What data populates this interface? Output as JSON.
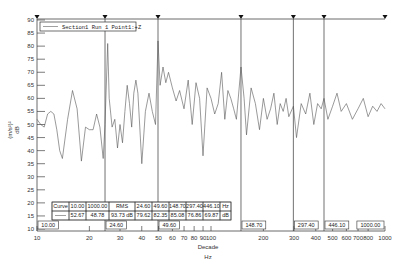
{
  "chart_data": {
    "type": "line",
    "title": "",
    "xlabel": "Decade",
    "xunit": "Hz",
    "ylabel": "(m/s²)²",
    "yunit": "dB",
    "xscale": "log",
    "xlim": [
      10,
      1000
    ],
    "ylim": [
      10,
      90
    ],
    "yticks": [
      10,
      15,
      20,
      25,
      30,
      35,
      40,
      45,
      50,
      55,
      60,
      65,
      70,
      75,
      80,
      85,
      90
    ],
    "xticks": [
      10,
      20,
      30,
      40,
      50,
      60,
      70,
      80,
      90,
      100,
      200,
      300,
      400,
      500,
      600,
      700,
      800,
      1000
    ],
    "xtick_labels": [
      "10",
      "20",
      "30",
      "40",
      "50",
      "60",
      "70",
      "80",
      "90",
      "100",
      "200",
      "300",
      "400",
      "500",
      "600",
      "700",
      "800",
      "1000"
    ],
    "grid": false,
    "legend": {
      "position": "top-left",
      "entries": [
        "Section1 Run 1 Point1:+Z"
      ]
    },
    "series": [
      {
        "name": "Section1 Run 1 Point1:+Z",
        "x": [
          10,
          10.5,
          11,
          11.5,
          12,
          12.5,
          13,
          13.5,
          14,
          15,
          16,
          17,
          18,
          19,
          20,
          21,
          22,
          23,
          24,
          24.6,
          25.5,
          26,
          27,
          28,
          29,
          30,
          31,
          32,
          33,
          34,
          35,
          36,
          37,
          38,
          40,
          42,
          44,
          46,
          48,
          49.6,
          51,
          53,
          55,
          57,
          60,
          63,
          66,
          70,
          74,
          78,
          82,
          86,
          90,
          95,
          100,
          105,
          110,
          115,
          120,
          125,
          130,
          135,
          140,
          148.7,
          155,
          160,
          170,
          180,
          190,
          200,
          210,
          220,
          230,
          240,
          250,
          260,
          270,
          280,
          297.4,
          310,
          330,
          350,
          370,
          390,
          410,
          430,
          446.1,
          470,
          500,
          530,
          560,
          600,
          650,
          700,
          750,
          800,
          850,
          900,
          950,
          1000
        ],
        "values": [
          52,
          50,
          49,
          54,
          55,
          54,
          48,
          40,
          37,
          52,
          63,
          56,
          36,
          49,
          48,
          48,
          54,
          49,
          37,
          50,
          81,
          60,
          49,
          52,
          41,
          50,
          43,
          55,
          65,
          58,
          49,
          62,
          67,
          62,
          35,
          55,
          62,
          55,
          50,
          82,
          65,
          72,
          66,
          70,
          64,
          59,
          63,
          56,
          67,
          50,
          66,
          60,
          38,
          64,
          60,
          54,
          58,
          70,
          52,
          63,
          60,
          56,
          52,
          72,
          60,
          46,
          64,
          58,
          48,
          60,
          52,
          56,
          62,
          50,
          58,
          55,
          60,
          53,
          57,
          45,
          58,
          54,
          62,
          50,
          58,
          56,
          60,
          52,
          57,
          62,
          55,
          58,
          52,
          56,
          60,
          53,
          57,
          55,
          58,
          56
        ]
      }
    ],
    "cursors": [
      {
        "label": "10.00",
        "x": 10
      },
      {
        "label": "24.60",
        "x": 24.6
      },
      {
        "label": "49.60",
        "x": 49.6
      },
      {
        "label": "148.70",
        "x": 148.7
      },
      {
        "label": "297.40",
        "x": 297.4
      },
      {
        "label": "446.10",
        "x": 446.1
      },
      {
        "label": "1000.00",
        "x": 1000
      }
    ],
    "table": {
      "header": [
        "Curve",
        "10.00",
        "1000.00",
        "RMS",
        "24.60",
        "49.60",
        "148.70",
        "297.40",
        "446.10",
        "Hz"
      ],
      "row": [
        "",
        "52.67",
        "48.78",
        "93.73 dB",
        "79.62",
        "82.35",
        "85.08",
        "76.86",
        "69.87",
        "dB"
      ]
    }
  }
}
